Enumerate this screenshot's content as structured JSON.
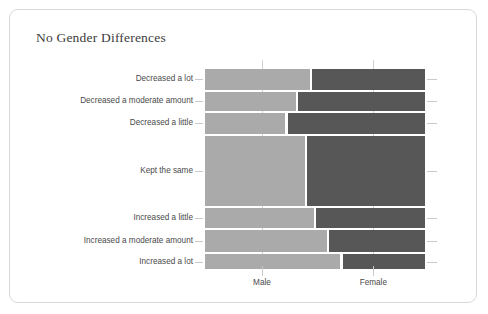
{
  "chart_data": {
    "type": "bar",
    "subtype": "mosaic",
    "title": "No Gender Differences",
    "xlabel": "",
    "ylabel": "",
    "grid": true,
    "legend_position": "none",
    "orientation": "horizontal",
    "x_categories": [
      "Male",
      "Female"
    ],
    "x_tick_labels": [
      "Male",
      "Female"
    ],
    "y_categories": [
      "Decreased a lot",
      "Decreased a moderate amount",
      "Decreased a little",
      "Kept the same",
      "Increased a little",
      "Increased a moderate amount",
      "Increased a lot"
    ],
    "series": [
      {
        "name": "Male",
        "color": "#aaaaaa",
        "values": [
          0.48,
          0.42,
          0.37,
          0.46,
          0.5,
          0.56,
          0.62
        ]
      },
      {
        "name": "Female",
        "color": "#575757",
        "values": [
          0.52,
          0.58,
          0.63,
          0.54,
          0.5,
          0.44,
          0.38
        ]
      }
    ],
    "row_heights_fraction": [
      0.105,
      0.095,
      0.105,
      0.355,
      0.1,
      0.11,
      0.075
    ],
    "xlim": [
      0,
      1
    ]
  },
  "panel": {
    "title": "No Gender Differences",
    "background_color": "#ffffff",
    "border_color": "#d8d8d8"
  },
  "axis": {
    "male_label": "Male",
    "female_label": "Female"
  },
  "rows": [
    {
      "label": "Decreased a lot",
      "male": 0.48,
      "female": 0.52,
      "height": 0.105
    },
    {
      "label": "Decreased a moderate amount",
      "male": 0.42,
      "female": 0.58,
      "height": 0.095
    },
    {
      "label": "Decreased a little",
      "male": 0.37,
      "female": 0.63,
      "height": 0.105
    },
    {
      "label": "Kept the same",
      "male": 0.46,
      "female": 0.54,
      "height": 0.355
    },
    {
      "label": "Increased a little",
      "male": 0.5,
      "female": 0.5,
      "height": 0.1
    },
    {
      "label": "Increased a moderate amount",
      "male": 0.56,
      "female": 0.44,
      "height": 0.11
    },
    {
      "label": "Increased a lot",
      "male": 0.62,
      "female": 0.38,
      "height": 0.075
    }
  ],
  "colors": {
    "male": "#aaaaaa",
    "female": "#575757",
    "grid": "#c9c9c9",
    "text": "#4a4a4a",
    "title": "#3b3b3b"
  }
}
